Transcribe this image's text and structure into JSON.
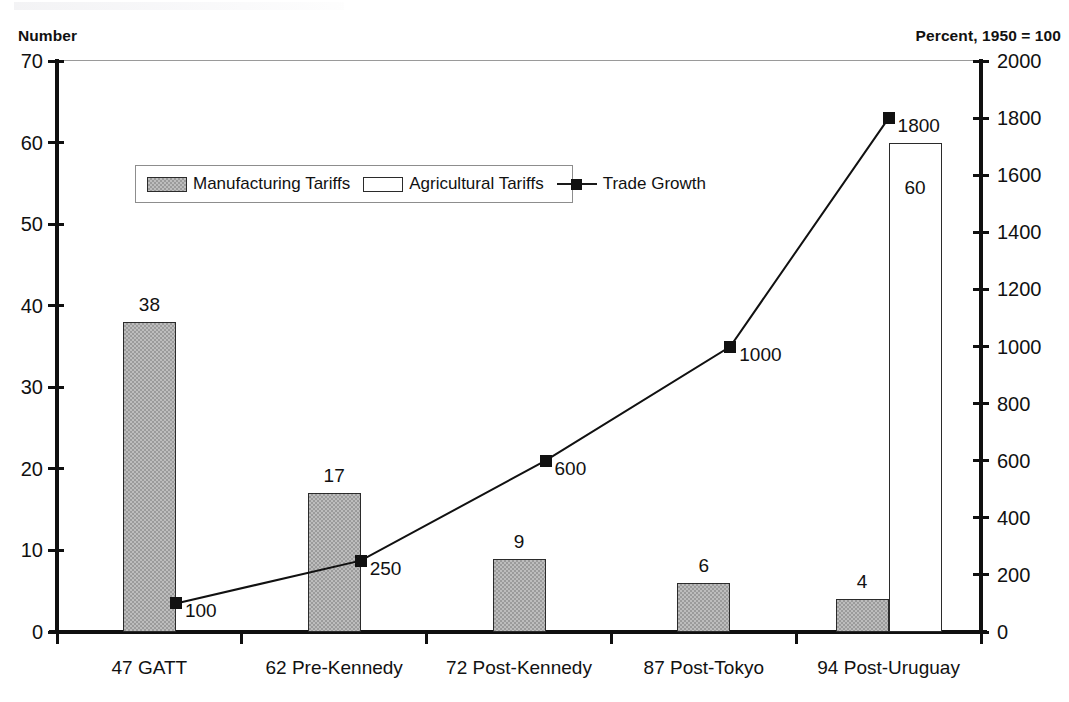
{
  "labels": {
    "left_axis_title": "Number",
    "right_axis_title": "Percent, 1950 = 100"
  },
  "legend": {
    "manufacturing": "Manufacturing Tariffs",
    "agricultural": "Agricultural Tariffs",
    "trade_growth": "Trade Growth"
  },
  "chart_data": {
    "type": "bar",
    "title": "",
    "subtitle": "",
    "xlabel": "",
    "ylabel": "Number",
    "y2label": "Percent, 1950 = 100",
    "ylim": [
      0,
      70
    ],
    "y2lim": [
      0,
      2000
    ],
    "yticks": [
      0,
      10,
      20,
      30,
      40,
      50,
      60,
      70
    ],
    "y2ticks": [
      0,
      200,
      400,
      600,
      800,
      1000,
      1200,
      1400,
      1600,
      1800,
      2000
    ],
    "ytick_labels": [
      "0",
      "10",
      "20",
      "30",
      "40",
      "50",
      "60",
      "70"
    ],
    "y2tick_labels": [
      "0",
      "200",
      "400",
      "600",
      "800",
      "1000",
      "1200",
      "1400",
      "1600",
      "1800",
      "2000"
    ],
    "grid": false,
    "legend_position": "upper left inside",
    "categories": [
      "47 GATT",
      "62 Pre-Kennedy",
      "72 Post-Kennedy",
      "87 Post-Tokyo",
      "94 Post-Uruguay"
    ],
    "series": [
      {
        "name": "Manufacturing Tariffs",
        "type": "bar",
        "axis": "left",
        "values": [
          38,
          17,
          9,
          6,
          4
        ],
        "labels": [
          "38",
          "17",
          "9",
          "6",
          "4"
        ],
        "color": "#bdbdbd"
      },
      {
        "name": "Agricultural Tariffs",
        "type": "bar",
        "axis": "left",
        "values": [
          null,
          null,
          null,
          null,
          60
        ],
        "labels": [
          "",
          "",
          "",
          "",
          "60"
        ],
        "color": "#ffffff"
      },
      {
        "name": "Trade Growth",
        "type": "line",
        "axis": "right",
        "values": [
          100,
          250,
          600,
          1000,
          1800
        ],
        "labels": [
          "100",
          "250",
          "600",
          "1000",
          "1800"
        ],
        "color": "#111111",
        "marker": "square"
      }
    ]
  }
}
